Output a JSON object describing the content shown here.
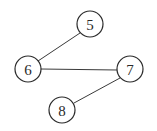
{
  "diagram": {
    "type": "undirected-graph",
    "nodes": [
      {
        "id": "5",
        "label": "5",
        "cx": 90,
        "cy": 24
      },
      {
        "id": "6",
        "label": "6",
        "cx": 28,
        "cy": 69
      },
      {
        "id": "7",
        "label": "7",
        "cx": 130,
        "cy": 69
      },
      {
        "id": "8",
        "label": "8",
        "cx": 62,
        "cy": 110
      }
    ],
    "edges": [
      {
        "from": "5",
        "to": "6"
      },
      {
        "from": "6",
        "to": "7"
      },
      {
        "from": "7",
        "to": "8"
      }
    ],
    "node_radius": 13,
    "colors": {
      "stroke": "#2a2a2a",
      "fill": "#ffffff",
      "background": "#ffffff"
    }
  }
}
